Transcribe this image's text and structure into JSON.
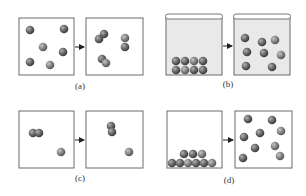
{
  "colors": {
    "box_stroke": "#6a6a6a",
    "box_fill": "#ffffff",
    "container_fill": "#e9e9e9",
    "particle_dark": "#4a4a4a",
    "particle_mid": "#7a7a7a",
    "arrow": "#222222"
  },
  "panels": [
    {
      "id": "a",
      "label": "(a)",
      "description": "Separate particles combine into pairs",
      "before": {
        "box": [
          19,
          18,
          55,
          57
        ],
        "particles": [
          [
            30,
            30
          ],
          [
            64,
            29
          ],
          [
            43,
            47
          ],
          [
            63,
            52
          ],
          [
            30,
            62
          ],
          [
            50,
            65
          ]
        ]
      },
      "after": {
        "box": [
          86,
          18,
          57,
          57
        ],
        "particles": [
          [
            99,
            39
          ],
          [
            104,
            34
          ],
          [
            125,
            38
          ],
          [
            125,
            47
          ],
          [
            102,
            59
          ],
          [
            106,
            63
          ]
        ]
      },
      "arrow": [
        75,
        47,
        85,
        47
      ],
      "label_pos": [
        80,
        89
      ]
    },
    {
      "id": "b",
      "label": "(b)",
      "description": "Packed solid in container becomes spread-out gas",
      "before": {
        "box": [
          166,
          17,
          56,
          58
        ],
        "lid": true,
        "filled": true,
        "particles": [
          [
            176,
            61
          ],
          [
            185,
            61
          ],
          [
            194,
            61
          ],
          [
            203,
            61
          ],
          [
            176,
            70
          ],
          [
            185,
            70
          ],
          [
            194,
            70
          ],
          [
            203,
            70
          ]
        ]
      },
      "after": {
        "box": [
          234,
          17,
          56,
          58
        ],
        "lid": true,
        "filled": true,
        "particles": [
          [
            245,
            38
          ],
          [
            262,
            42
          ],
          [
            275,
            40
          ],
          [
            247,
            52
          ],
          [
            264,
            53
          ],
          [
            281,
            55
          ],
          [
            246,
            66
          ],
          [
            272,
            67
          ]
        ]
      },
      "arrow": [
        223,
        46,
        233,
        46
      ],
      "label_pos": [
        228,
        87
      ]
    },
    {
      "id": "c",
      "label": "(c)",
      "description": "Pair of particles reorients; single particle remains",
      "before": {
        "box": [
          19,
          111,
          55,
          57
        ],
        "particles": [
          [
            33,
            133
          ],
          [
            39,
            133
          ],
          [
            61,
            152
          ]
        ]
      },
      "after": {
        "box": [
          86,
          111,
          57,
          57
        ],
        "particles": [
          [
            111,
            126
          ],
          [
            112,
            132
          ],
          [
            129,
            152
          ]
        ]
      },
      "arrow": [
        75,
        140,
        85,
        140
      ],
      "label_pos": [
        80,
        181
      ]
    },
    {
      "id": "d",
      "label": "(d)",
      "description": "Particles piled at bottom spread out throughout box",
      "before": {
        "box": [
          167,
          111,
          55,
          57
        ],
        "particles": [
          [
            172,
            163
          ],
          [
            180,
            163
          ],
          [
            188,
            163
          ],
          [
            196,
            163
          ],
          [
            204,
            163
          ],
          [
            212,
            163
          ],
          [
            184,
            154
          ],
          [
            193,
            154
          ],
          [
            202,
            154
          ]
        ]
      },
      "after": {
        "box": [
          235,
          111,
          57,
          57
        ],
        "particles": [
          [
            248,
            119
          ],
          [
            272,
            120
          ],
          [
            281,
            131
          ],
          [
            244,
            137
          ],
          [
            260,
            133
          ],
          [
            275,
            146
          ],
          [
            255,
            148
          ],
          [
            243,
            158
          ],
          [
            280,
            156
          ]
        ]
      },
      "arrow": [
        223,
        140,
        234,
        140
      ],
      "label_pos": [
        229,
        183
      ]
    }
  ]
}
